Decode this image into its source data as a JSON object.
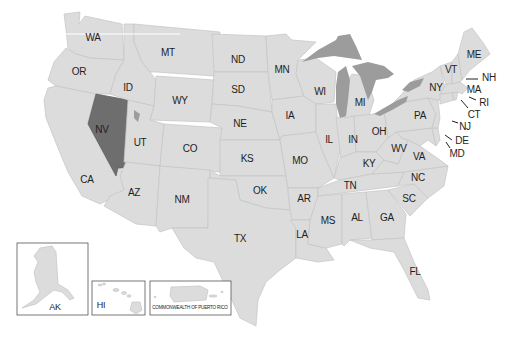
{
  "map": {
    "title": "United States map",
    "highlight_color": "#6e6e6e",
    "base_color": "#dcdcdc",
    "lake_color": "#9c9c9c",
    "highlighted_state": "NV",
    "states": {
      "WA": "WA",
      "OR": "OR",
      "CA": "CA",
      "ID": "ID",
      "NV": "NV",
      "UT": "UT",
      "AZ": "AZ",
      "MT": "MT",
      "WY": "WY",
      "CO": "CO",
      "NM": "NM",
      "ND": "ND",
      "SD": "SD",
      "NE": "NE",
      "KS": "KS",
      "OK": "OK",
      "TX": "TX",
      "MN": "MN",
      "IA": "IA",
      "MO": "MO",
      "AR": "AR",
      "LA": "LA",
      "WI": "WI",
      "IL": "IL",
      "MS": "MS",
      "MI": "MI",
      "IN": "IN",
      "KY": "KY",
      "TN": "TN",
      "AL": "AL",
      "OH": "OH",
      "WV": "WV",
      "GA": "GA",
      "FL": "FL",
      "SC": "SC",
      "NC": "NC",
      "VA": "VA",
      "PA": "PA",
      "NY": "NY",
      "VT": "VT",
      "ME": "ME",
      "NH": "NH",
      "MA": "MA",
      "RI": "RI",
      "CT": "CT",
      "NJ": "NJ",
      "DE": "DE",
      "MD": "MD"
    },
    "insets": {
      "alaska": "AK",
      "hawaii": "HI",
      "puerto_rico": "COMMONWEALTH OF PUERTO RICO"
    }
  }
}
